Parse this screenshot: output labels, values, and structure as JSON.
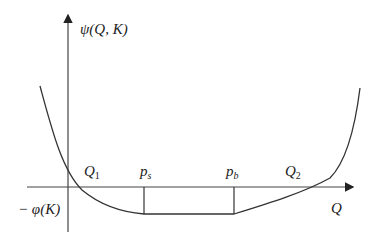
{
  "diagram": {
    "y_axis_label": "ψ(Q, K)",
    "x_axis_label": "Q",
    "y_intercept_label": "− φ(K)",
    "points": [
      {
        "name": "Q",
        "sub": "1"
      },
      {
        "name": "p",
        "sub": "s"
      },
      {
        "name": "p",
        "sub": "b"
      },
      {
        "name": "Q",
        "sub": "2"
      }
    ],
    "colors": {
      "line": "#333333",
      "text": "#222222",
      "background": "#ffffff"
    }
  }
}
